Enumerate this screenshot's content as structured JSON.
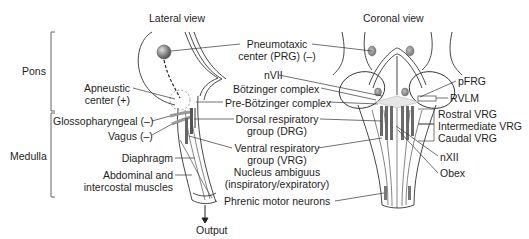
{
  "views": {
    "lateral": {
      "title": "Lateral view"
    },
    "coronal": {
      "title": "Coronal view"
    }
  },
  "regions": {
    "pons": "Pons",
    "medulla": "Medulla"
  },
  "lateral_labels": {
    "apneustic_line1": "Apneustic",
    "apneustic_line2": "center (+)",
    "glossopharyngeal": "Glossopharyngeal (–)",
    "vagus": "Vagus (–)",
    "diaphragm": "Diaphragm",
    "abdominal_line1": "Abdominal and",
    "abdominal_line2": "intercostal muscles",
    "output": "Output"
  },
  "center_labels": {
    "pneumotaxic_line1": "Pneumotaxic",
    "pneumotaxic_line2": "center (PRG) (–)",
    "nvii": "nVII",
    "botzinger": "Bötzinger complex",
    "pre_botzinger": "Pre-Bötzinger complex",
    "drg_line1": "Dorsal respiratory",
    "drg_line2": "group (DRG)",
    "vrg_line1": "Ventral respiratory",
    "vrg_line2": "group (VRG)",
    "nucleus_line1": "Nucleus ambiguus",
    "nucleus_line2": "(inspiratory/expiratory)",
    "phrenic": "Phrenic motor neurons"
  },
  "coronal_labels": {
    "pfrg": "pFRG",
    "rvlm": "RVLM",
    "rostral_vrg": "Rostral VRG",
    "intermediate_vrg": "Intermediate VRG",
    "caudal_vrg": "Caudal VRG",
    "nxii": "nXII",
    "obex": "Obex"
  },
  "colors": {
    "line": "#333333",
    "nucleus_fill": "#8a8a8a",
    "column_fill": "#6e6e6e",
    "bracket": "#555555"
  }
}
